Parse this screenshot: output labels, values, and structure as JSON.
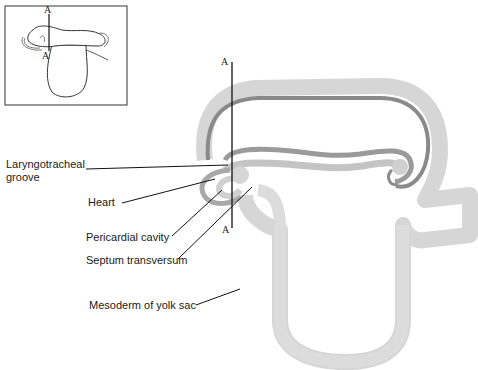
{
  "inset": {
    "section_top_label": "A",
    "section_bottom_label": "A"
  },
  "main": {
    "section_top_label": "A",
    "section_bottom_label": "A"
  },
  "labels": [
    {
      "id": "laryngotracheal-groove",
      "line1": "Laryngotracheal",
      "line2": "groove"
    },
    {
      "id": "heart",
      "text": "Heart"
    },
    {
      "id": "pericardial-cavity",
      "text": "Pericardial cavity"
    },
    {
      "id": "septum-transversum",
      "text": "Septum transversum"
    },
    {
      "id": "mesoderm-of-yolk-sac",
      "text": "Mesoderm of yolk sac"
    }
  ],
  "colors": {
    "light_tissue": "#d9d9d9",
    "mid_tissue": "#bdbdbd",
    "dark_tissue": "#8a8a8a",
    "line": "#111111"
  }
}
